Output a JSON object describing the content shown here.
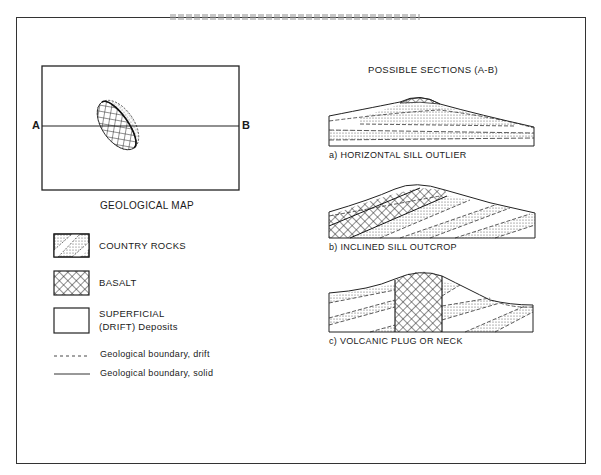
{
  "map": {
    "title": "GEOLOGICAL MAP",
    "label_a": "A",
    "label_b": "B"
  },
  "legend": {
    "items": [
      {
        "pattern": "dotted-stripe",
        "label": "COUNTRY ROCKS"
      },
      {
        "pattern": "crosshatch",
        "label": "BASALT"
      },
      {
        "pattern": "blank",
        "label_line1": "SUPERFICIAL",
        "label_line2": "(DRIFT)  Deposits"
      },
      {
        "pattern": "dashed-line",
        "label": "Geological boundary, drift"
      },
      {
        "pattern": "solid-line",
        "label": "Geological boundary, solid"
      }
    ]
  },
  "sections": {
    "title": "POSSIBLE SECTIONS (A-B)",
    "items": [
      {
        "caption": "a) HORIZONTAL SILL OUTLIER"
      },
      {
        "caption": "b) INCLINED SILL OUTCROP"
      },
      {
        "caption": "c) VOLCANIC PLUG OR NECK"
      }
    ]
  },
  "colors": {
    "ink": "#1a1a1a",
    "paper": "#ffffff"
  }
}
